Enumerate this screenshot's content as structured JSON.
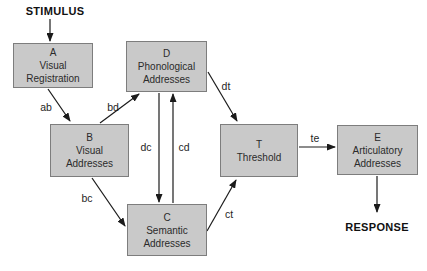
{
  "diagram": {
    "stimulus_label": "STIMULUS",
    "response_label": "RESPONSE",
    "colors": {
      "background": "#ffffff",
      "box_fill": "#c9c9c9",
      "box_border": "#7d7d7d",
      "arrow": "#1b1b1b",
      "text": "#2b2b2b"
    },
    "nodes": {
      "A": {
        "letter": "A",
        "line1": "Visual",
        "line2": "Registration"
      },
      "B": {
        "letter": "B",
        "line1": "Visual",
        "line2": "Addresses"
      },
      "C": {
        "letter": "C",
        "line1": "Semantic",
        "line2": "Addresses"
      },
      "D": {
        "letter": "D",
        "line1": "Phonological",
        "line2": "Addresses"
      },
      "T": {
        "letter": "T",
        "line1": "Threshold"
      },
      "E": {
        "letter": "E",
        "line1": "Articulatory",
        "line2": "Addresses"
      }
    },
    "edges": [
      {
        "from": "STIMULUS",
        "to": "A",
        "label": ""
      },
      {
        "from": "A",
        "to": "B",
        "label": "ab"
      },
      {
        "from": "B",
        "to": "D",
        "label": "bd"
      },
      {
        "from": "D",
        "to": "C",
        "label": "dc"
      },
      {
        "from": "C",
        "to": "D",
        "label": "cd"
      },
      {
        "from": "B",
        "to": "C",
        "label": "bc"
      },
      {
        "from": "D",
        "to": "T",
        "label": "dt"
      },
      {
        "from": "C",
        "to": "T",
        "label": "ct"
      },
      {
        "from": "T",
        "to": "E",
        "label": "te"
      },
      {
        "from": "E",
        "to": "RESPONSE",
        "label": ""
      }
    ]
  }
}
